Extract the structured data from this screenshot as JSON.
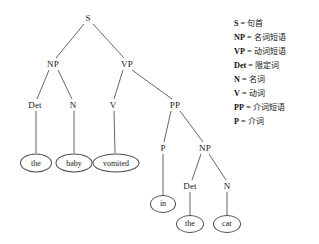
{
  "diagram": {
    "sentence": "the baby vomited in the car",
    "colors": {
      "background": "#ffffff",
      "edge": "#555555",
      "text": "#1a1a1a",
      "leaf_border": "#4a4a4a"
    },
    "nodes": [
      {
        "id": "S",
        "label": "S",
        "x": 88,
        "y": 18,
        "type": "internal"
      },
      {
        "id": "NP1",
        "label": "NP",
        "x": 53,
        "y": 64,
        "type": "internal"
      },
      {
        "id": "VP",
        "label": "VP",
        "x": 127,
        "y": 64,
        "type": "internal"
      },
      {
        "id": "Det1",
        "label": "Det",
        "x": 35,
        "y": 105,
        "type": "internal"
      },
      {
        "id": "N1",
        "label": "N",
        "x": 73,
        "y": 105,
        "type": "internal"
      },
      {
        "id": "V",
        "label": "V",
        "x": 113,
        "y": 105,
        "type": "internal"
      },
      {
        "id": "PP",
        "label": "PP",
        "x": 175,
        "y": 105,
        "type": "internal"
      },
      {
        "id": "P",
        "label": "P",
        "x": 163,
        "y": 148,
        "type": "internal"
      },
      {
        "id": "NP2",
        "label": "NP",
        "x": 205,
        "y": 148,
        "type": "internal"
      },
      {
        "id": "Det2",
        "label": "Det",
        "x": 190,
        "y": 186,
        "type": "internal"
      },
      {
        "id": "N2",
        "label": "N",
        "x": 227,
        "y": 186,
        "type": "internal"
      }
    ],
    "leaves": [
      {
        "id": "the1",
        "label": "the",
        "x": 36,
        "y": 163,
        "w": 32,
        "h": 19
      },
      {
        "id": "baby",
        "label": "baby",
        "x": 74,
        "y": 163,
        "w": 37,
        "h": 19
      },
      {
        "id": "vomited",
        "label": "vomited",
        "x": 116,
        "y": 163,
        "w": 47,
        "h": 19
      },
      {
        "id": "in",
        "label": "in",
        "x": 163,
        "y": 204,
        "w": 26,
        "h": 18
      },
      {
        "id": "the2",
        "label": "the",
        "x": 190,
        "y": 224,
        "w": 28,
        "h": 18
      },
      {
        "id": "car",
        "label": "car",
        "x": 227,
        "y": 224,
        "w": 28,
        "h": 18
      }
    ],
    "edges": [
      {
        "from": "S",
        "to": "NP1",
        "x1": 84,
        "y1": 24,
        "x2": 56,
        "y2": 58
      },
      {
        "from": "S",
        "to": "VP",
        "x1": 93,
        "y1": 24,
        "x2": 124,
        "y2": 58
      },
      {
        "from": "NP1",
        "to": "Det1",
        "x1": 49,
        "y1": 70,
        "x2": 37,
        "y2": 99
      },
      {
        "from": "NP1",
        "to": "N1",
        "x1": 58,
        "y1": 70,
        "x2": 72,
        "y2": 99
      },
      {
        "from": "VP",
        "to": "V",
        "x1": 123,
        "y1": 70,
        "x2": 114,
        "y2": 99
      },
      {
        "from": "VP",
        "to": "PP",
        "x1": 132,
        "y1": 70,
        "x2": 172,
        "y2": 99
      },
      {
        "from": "PP",
        "to": "P",
        "x1": 171,
        "y1": 111,
        "x2": 164,
        "y2": 142
      },
      {
        "from": "PP",
        "to": "NP2",
        "x1": 180,
        "y1": 111,
        "x2": 203,
        "y2": 142
      },
      {
        "from": "NP2",
        "to": "Det2",
        "x1": 201,
        "y1": 154,
        "x2": 192,
        "y2": 180
      },
      {
        "from": "NP2",
        "to": "N2",
        "x1": 209,
        "y1": 154,
        "x2": 226,
        "y2": 180
      },
      {
        "from": "Det1",
        "to": "the1",
        "x1": 36,
        "y1": 111,
        "x2": 36,
        "y2": 153
      },
      {
        "from": "N1",
        "to": "baby",
        "x1": 74,
        "y1": 111,
        "x2": 74,
        "y2": 153
      },
      {
        "from": "V",
        "to": "vomited",
        "x1": 114,
        "y1": 111,
        "x2": 115,
        "y2": 153
      },
      {
        "from": "P",
        "to": "in",
        "x1": 163,
        "y1": 154,
        "x2": 163,
        "y2": 195
      },
      {
        "from": "Det2",
        "to": "the2",
        "x1": 190,
        "y1": 192,
        "x2": 190,
        "y2": 215
      },
      {
        "from": "N2",
        "to": "car",
        "x1": 227,
        "y1": 192,
        "x2": 227,
        "y2": 215
      }
    ]
  },
  "legend": {
    "separator": "=",
    "items": [
      {
        "symbol": "S",
        "definition": "句首"
      },
      {
        "symbol": "NP",
        "definition": "名词短语"
      },
      {
        "symbol": "VP",
        "definition": "动词短语"
      },
      {
        "symbol": "Det",
        "definition": "限定词"
      },
      {
        "symbol": "N",
        "definition": "名词"
      },
      {
        "symbol": "V",
        "definition": "动词"
      },
      {
        "symbol": "PP",
        "definition": "介词短语"
      },
      {
        "symbol": "P",
        "definition": "介词"
      }
    ]
  }
}
